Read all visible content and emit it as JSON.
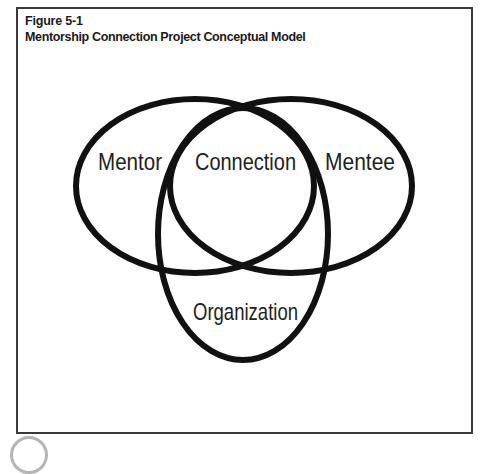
{
  "figure": {
    "number": "Figure 5-1",
    "title": "Mentorship Connection Project Conceptual Model"
  },
  "diagram": {
    "type": "venn",
    "circles": [
      {
        "id": "mentor",
        "label": "Mentor"
      },
      {
        "id": "mentee",
        "label": "Mentee"
      },
      {
        "id": "organization",
        "label": "Organization"
      }
    ],
    "intersection_label": "Connection",
    "labels": {
      "mentor": "Mentor",
      "connection": "Connection",
      "mentee": "Mentee",
      "organization": "Organization"
    },
    "stroke_color": "#111111"
  }
}
